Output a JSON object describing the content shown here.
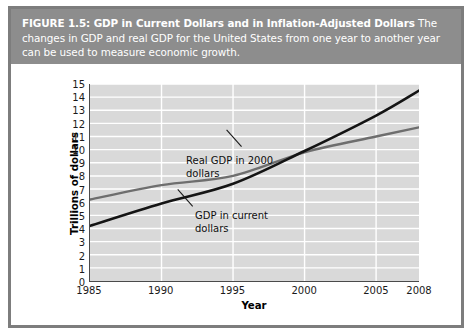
{
  "figure": {
    "caption_lead": "FIGURE 1.5: GDP in Current Dollars and in Inflation-Adjusted Dollars",
    "caption_body": " The changes in GDP and real GDP for the United States from one year to another year can be used to measure economic growth."
  },
  "colors": {
    "caption_band": "#8d8d8d",
    "caption_text": "#ffffff",
    "plot_background": "#d9d9d9",
    "gridline": "#ffffff",
    "axis": "#4a4a4a",
    "series_current_gdp": "#141414",
    "series_real_gdp": "#6e6e6e",
    "frame_border": "#7d7d7d"
  },
  "chart_data": {
    "type": "line",
    "title": "GDP in Current Dollars and in Inflation-Adjusted Dollars",
    "xlabel": "Year",
    "ylabel": "Trillions of dollars",
    "xlim": [
      1985,
      2008
    ],
    "ylim": [
      0,
      15
    ],
    "grid": true,
    "legend_position": "inline-annotations",
    "xticks": [
      1985,
      1990,
      1995,
      2000,
      2005,
      2008
    ],
    "xtick_labels": [
      "1985",
      "1990",
      "1995",
      "2000",
      "2005",
      "2008"
    ],
    "yticks": [
      0,
      1,
      2,
      3,
      4,
      5,
      6,
      7,
      8,
      9,
      10,
      11,
      12,
      13,
      14,
      15
    ],
    "ytick_labels": [
      "0",
      "1",
      "2",
      "3",
      "4",
      "5",
      "6",
      "7",
      "8",
      "9",
      "10",
      "11",
      "12",
      "13",
      "14",
      "15"
    ],
    "x": [
      1985,
      1990,
      1995,
      2000,
      2005,
      2008
    ],
    "series": [
      {
        "name": "GDP in current dollars",
        "color": "#141414",
        "values": [
          4.2,
          5.9,
          7.4,
          9.9,
          12.6,
          14.5
        ],
        "annotation": "GDP in current\ndollars"
      },
      {
        "name": "Real GDP in 2000 dollars",
        "color": "#6e6e6e",
        "values": [
          6.2,
          7.3,
          8.0,
          9.8,
          11.0,
          11.7
        ],
        "annotation": "Real GDP in 2000\ndollars"
      }
    ]
  }
}
